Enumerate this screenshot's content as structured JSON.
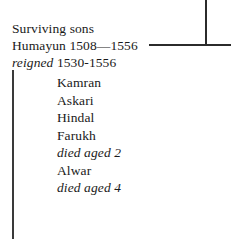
{
  "canvas": {
    "width": 231,
    "height": 239,
    "background": "#ffffff",
    "text_color": "#1a1a1a",
    "rule_color": "#2b2b2b"
  },
  "heading": {
    "line1": "Surviving sons",
    "line2": "Humayun 1508—1556",
    "line3_italic": "reigned",
    "line3_roman": "1530-1556"
  },
  "children": [
    {
      "text": "Kamran",
      "italic": false
    },
    {
      "text": "Askari",
      "italic": false
    },
    {
      "text": "Hindal",
      "italic": false
    },
    {
      "text": "Farukh",
      "italic": false
    },
    {
      "text": "died aged 2",
      "italic": true
    },
    {
      "text": "Alwar",
      "italic": false
    },
    {
      "text": "died aged 4",
      "italic": true
    }
  ]
}
